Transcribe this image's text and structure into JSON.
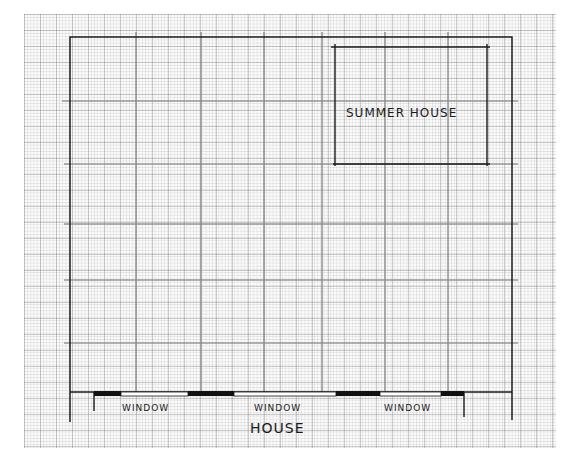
{
  "diagram": {
    "type": "garden-plan-sketch",
    "background": "graph-paper",
    "labels": {
      "summer_house": "SUMMER HOUSE",
      "house": "HOUSE",
      "windows": [
        "WINDOW",
        "WINDOW",
        "WINDOW"
      ]
    },
    "colors": {
      "ink": "#1b1b1b",
      "pencil": "#8a8a8a",
      "paper": "#fbfbfb",
      "grid": "#c8c8c8"
    },
    "pencil_grid": {
      "vertical_x": [
        136,
        201,
        264,
        322,
        385,
        448
      ],
      "horizontal_y": [
        101,
        164,
        224,
        280,
        343
      ]
    },
    "boundary": {
      "left": 70,
      "top": 37,
      "right": 512,
      "bottom": 392
    },
    "summer_house_rect": {
      "left": 335,
      "top": 47,
      "right": 487,
      "bottom": 164
    },
    "house_wall": {
      "y": 392,
      "solid_segments": [
        [
          94,
          121
        ],
        [
          188,
          234
        ],
        [
          336,
          380
        ],
        [
          441,
          464
        ]
      ],
      "window_segments": [
        [
          121,
          188
        ],
        [
          234,
          336
        ],
        [
          380,
          441
        ]
      ]
    }
  }
}
